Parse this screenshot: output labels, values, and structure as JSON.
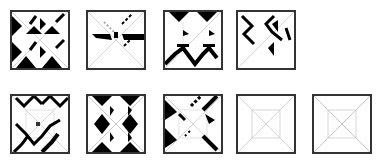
{
  "figure": {
    "rows": [
      {
        "tiles": [
          {
            "id": "r1-t1",
            "pattern": "dense-triangles"
          },
          {
            "id": "r1-t2",
            "pattern": "sparse-center-bar"
          },
          {
            "id": "r1-t3",
            "pattern": "chevron-bottom"
          },
          {
            "id": "r1-t4",
            "pattern": "x-diagonal-partial"
          }
        ]
      },
      {
        "tiles": [
          {
            "id": "r2-t1",
            "pattern": "zigzag-lines"
          },
          {
            "id": "r2-t2",
            "pattern": "diamond-dense"
          },
          {
            "id": "r2-t3",
            "pattern": "diagonal-dense-partial"
          },
          {
            "id": "r2-t4",
            "pattern": "empty-guides"
          },
          {
            "id": "r2-t5",
            "pattern": "empty-guides"
          }
        ]
      }
    ],
    "colors": {
      "ink": "#000000",
      "guide": "#c8c8c8",
      "frame": "#333333"
    }
  }
}
